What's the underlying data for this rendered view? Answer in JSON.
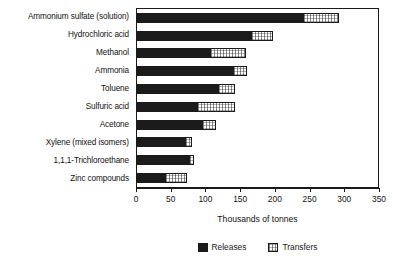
{
  "chart_data": {
    "type": "bar",
    "orientation": "horizontal",
    "stacked": true,
    "title": "",
    "xlabel": "Thousands of tonnes",
    "ylabel": "",
    "xlim": [
      0,
      350
    ],
    "xticks": [
      0,
      50,
      100,
      150,
      200,
      250,
      300,
      350
    ],
    "grid": false,
    "legend_position": "bottom",
    "categories": [
      "Ammonium sulfate (solution)",
      "Hydrochloric acid",
      "Methanol",
      "Ammonia",
      "Toluene",
      "Sulfuric acid",
      "Acetone",
      "Xylene (mixed isomers)",
      "1,1,1-Trichloroethane",
      "Zinc compounds"
    ],
    "series": [
      {
        "name": "Releases",
        "color": "#1b1b1b",
        "values": [
          239,
          164,
          105,
          138,
          117,
          86,
          94,
          69,
          75,
          40
        ]
      },
      {
        "name": "Transfers",
        "color": "#ffffff",
        "values": [
          52,
          32,
          52,
          20,
          24,
          55,
          20,
          10,
          7,
          32
        ]
      }
    ],
    "totals": [
      291,
      196,
      157,
      158,
      141,
      141,
      114,
      79,
      82,
      72
    ]
  },
  "axis": {
    "x_title": "Thousands of tonnes",
    "tick_labels": [
      "0",
      "50",
      "100",
      "150",
      "200",
      "250",
      "300",
      "350"
    ]
  },
  "legend": {
    "entries": [
      {
        "label": "Releases",
        "swatch": "filled-black-swatch"
      },
      {
        "label": "Transfers",
        "swatch": "hatched-white-swatch"
      }
    ]
  }
}
